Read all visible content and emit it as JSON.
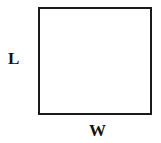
{
  "diagram": {
    "shape": "rectangle",
    "labels": {
      "side_length": "L",
      "side_width": "W"
    },
    "colors": {
      "stroke": "#1a1a1a",
      "fill": "#ffffff",
      "text": "#111111"
    }
  }
}
